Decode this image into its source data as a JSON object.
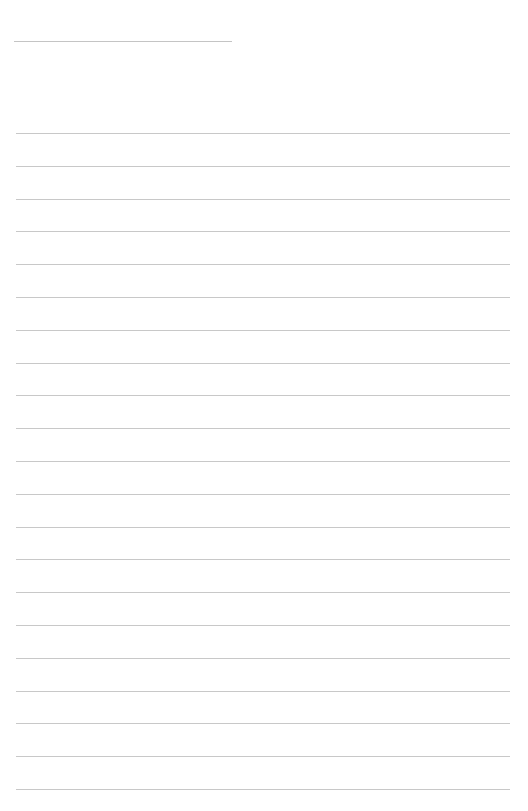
{
  "page": {
    "type": "lined-paper",
    "background_color": "#ffffff",
    "line_color": "#c8c8c8",
    "title_line": {
      "x": 14,
      "y": 41,
      "width": 218
    },
    "ruled_lines": {
      "count": 21,
      "first_y": 133,
      "spacing": 32.8,
      "x": 16,
      "width": 494
    }
  }
}
